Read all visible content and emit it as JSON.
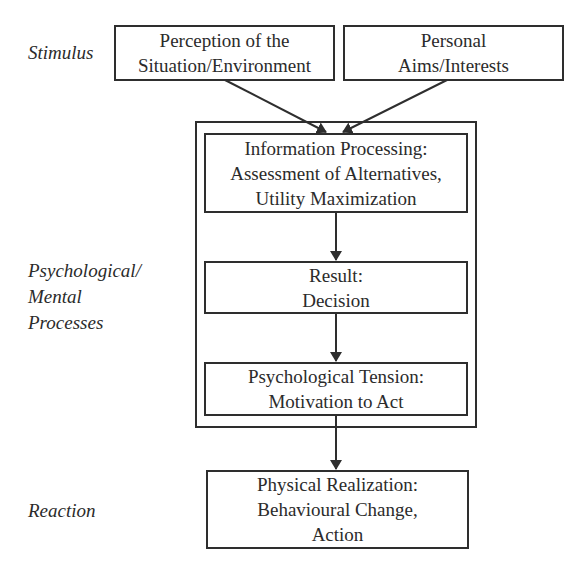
{
  "side_labels": {
    "stimulus": "Stimulus",
    "psych": [
      "Psychological/",
      "Mental",
      "Processes"
    ],
    "reaction": "Reaction"
  },
  "boxes": {
    "perception": [
      "Perception of the",
      "Situation/Environment"
    ],
    "aims": [
      "Personal",
      "Aims/Interests"
    ],
    "info": [
      "Information Processing:",
      "Assessment of Alternatives,",
      "Utility Maximization"
    ],
    "result": [
      "Result:",
      "Decision"
    ],
    "tension": [
      "Psychological Tension:",
      "Motivation to Act"
    ],
    "physical": [
      "Physical Realization:",
      "Behavioural Change,",
      "Action"
    ]
  },
  "colors": {
    "stroke": "#2e2e2e",
    "text": "#2b2b2b",
    "background": "#ffffff"
  }
}
